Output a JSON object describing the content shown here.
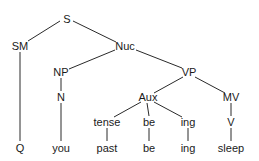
{
  "diagram": {
    "type": "syntax-tree",
    "nodes": [
      {
        "id": "S",
        "label": "S",
        "x": 67,
        "y": 19
      },
      {
        "id": "SM",
        "label": "SM",
        "x": 20,
        "y": 46
      },
      {
        "id": "Nuc",
        "label": "Nuc",
        "x": 125,
        "y": 46
      },
      {
        "id": "NP",
        "label": "NP",
        "x": 61,
        "y": 72
      },
      {
        "id": "VP",
        "label": "VP",
        "x": 189,
        "y": 72
      },
      {
        "id": "N",
        "label": "N",
        "x": 61,
        "y": 97
      },
      {
        "id": "Aux",
        "label": "Aux",
        "x": 148,
        "y": 97
      },
      {
        "id": "MV",
        "label": "MV",
        "x": 231,
        "y": 97
      },
      {
        "id": "tense",
        "label": "tense",
        "x": 107,
        "y": 122
      },
      {
        "id": "be1",
        "label": "be",
        "x": 149,
        "y": 122
      },
      {
        "id": "ing1",
        "label": "ing",
        "x": 188,
        "y": 122
      },
      {
        "id": "V",
        "label": "V",
        "x": 231,
        "y": 122
      },
      {
        "id": "Q",
        "label": "Q",
        "x": 20,
        "y": 148
      },
      {
        "id": "you",
        "label": "you",
        "x": 61,
        "y": 148
      },
      {
        "id": "past",
        "label": "past",
        "x": 107,
        "y": 148
      },
      {
        "id": "be2",
        "label": "be",
        "x": 149,
        "y": 148
      },
      {
        "id": "ing2",
        "label": "ing",
        "x": 188,
        "y": 148
      },
      {
        "id": "sleep",
        "label": "sleep",
        "x": 231,
        "y": 148
      }
    ],
    "edges": [
      {
        "from": "S",
        "to": "SM",
        "x1": 60,
        "y1": 21,
        "x2": 28,
        "y2": 41
      },
      {
        "from": "S",
        "to": "Nuc",
        "x1": 73,
        "y1": 21,
        "x2": 116,
        "y2": 42
      },
      {
        "from": "SM",
        "to": "Q",
        "x1": 20,
        "y1": 52,
        "x2": 20,
        "y2": 141
      },
      {
        "from": "Nuc",
        "to": "NP",
        "x1": 115,
        "y1": 50,
        "x2": 69,
        "y2": 69
      },
      {
        "from": "Nuc",
        "to": "VP",
        "x1": 136,
        "y1": 50,
        "x2": 182,
        "y2": 68
      },
      {
        "from": "NP",
        "to": "N",
        "x1": 61,
        "y1": 78,
        "x2": 61,
        "y2": 91
      },
      {
        "from": "N",
        "to": "you",
        "x1": 61,
        "y1": 103,
        "x2": 61,
        "y2": 141
      },
      {
        "from": "VP",
        "to": "Aux",
        "x1": 183,
        "y1": 77,
        "x2": 154,
        "y2": 93
      },
      {
        "from": "VP",
        "to": "MV",
        "x1": 195,
        "y1": 77,
        "x2": 225,
        "y2": 93
      },
      {
        "from": "Aux",
        "to": "tense",
        "x1": 141,
        "y1": 102,
        "x2": 114,
        "y2": 117
      },
      {
        "from": "Aux",
        "to": "be1",
        "x1": 147,
        "y1": 103,
        "x2": 149,
        "y2": 116
      },
      {
        "from": "Aux",
        "to": "ing1",
        "x1": 154,
        "y1": 102,
        "x2": 182,
        "y2": 117
      },
      {
        "from": "MV",
        "to": "V",
        "x1": 231,
        "y1": 103,
        "x2": 231,
        "y2": 116
      },
      {
        "from": "tense",
        "to": "past",
        "x1": 107,
        "y1": 128,
        "x2": 107,
        "y2": 141
      },
      {
        "from": "be1",
        "to": "be2",
        "x1": 149,
        "y1": 128,
        "x2": 149,
        "y2": 141
      },
      {
        "from": "ing1",
        "to": "ing2",
        "x1": 188,
        "y1": 128,
        "x2": 188,
        "y2": 141
      },
      {
        "from": "V",
        "to": "sleep",
        "x1": 231,
        "y1": 128,
        "x2": 231,
        "y2": 141
      }
    ]
  }
}
